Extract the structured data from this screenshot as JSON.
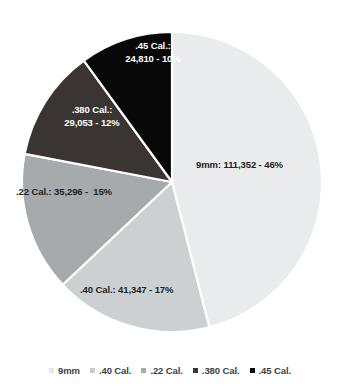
{
  "chart_data": {
    "type": "pie",
    "title": "",
    "categories": [
      "9mm",
      ".40 Cal.",
      ".22 Cal.",
      ".380 Cal.",
      ".45 Cal."
    ],
    "values": [
      111352,
      41347,
      35296,
      29053,
      24810
    ],
    "percentages": [
      46,
      17,
      15,
      12,
      10
    ],
    "colors": [
      "#e9ebec",
      "#ccd0d2",
      "#a7aaac",
      "#3a3533",
      "#080808"
    ],
    "legend_position": "bottom",
    "start_angle_deg": 0,
    "direction": "clockwise",
    "slice_border_color": "#ffffff",
    "slices": [
      {
        "name": "9mm",
        "value": 111352,
        "percent": 46,
        "color": "#e9ebec",
        "label": "9mm: 111,352 - 46%",
        "label_color": "#231f20"
      },
      {
        "name": ".40 Cal.",
        "value": 41347,
        "percent": 17,
        "color": "#ccd0d2",
        "label": ".40 Cal.: 41,347 - 17%",
        "label_color": "#231f20"
      },
      {
        "name": ".22 Cal.",
        "value": 35296,
        "percent": 15,
        "color": "#a7aaac",
        "label": ".22 Cal.: 35,296 -  15%",
        "label_color": "#231f20"
      },
      {
        "name": ".380 Cal.",
        "value": 29053,
        "percent": 12,
        "color": "#3a3533",
        "label": ".380 Cal.:\n29,053 - 12%",
        "label_color": "#ffffff"
      },
      {
        "name": ".45 Cal.",
        "value": 24810,
        "percent": 10,
        "color": "#080808",
        "label": ".45 Cal.:\n24,810 - 10%",
        "label_color": "#ffffff"
      }
    ]
  },
  "legend": {
    "items": [
      {
        "label": "9mm",
        "color": "#e3e5e7"
      },
      {
        "label": ".40 Cal.",
        "color": "#c9cccf"
      },
      {
        "label": ".22 Cal.",
        "color": "#a9acae"
      },
      {
        "label": ".380 Cal.",
        "color": "#3a3533"
      },
      {
        "label": ".45 Cal.",
        "color": "#0a0a0a"
      }
    ]
  }
}
